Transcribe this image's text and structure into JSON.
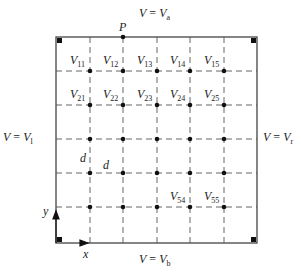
{
  "diagram": {
    "type": "finite-difference grid",
    "boundaries": {
      "top": {
        "var": "V",
        "eq": "=",
        "val": "V",
        "sub": "a"
      },
      "bottom": {
        "var": "V",
        "eq": "=",
        "val": "V",
        "sub": "b"
      },
      "left": {
        "var": "V",
        "eq": "=",
        "val": "V",
        "sub": "l"
      },
      "right": {
        "var": "V",
        "eq": "=",
        "val": "V",
        "sub": "r"
      }
    },
    "point_label": "P",
    "spacing_label_vertical": "d",
    "spacing_label_horizontal": "d",
    "axes": {
      "x": "x",
      "y": "y"
    },
    "nodes": [
      {
        "v": "V",
        "sub": "11"
      },
      {
        "v": "V",
        "sub": "12"
      },
      {
        "v": "V",
        "sub": "13"
      },
      {
        "v": "V",
        "sub": "14"
      },
      {
        "v": "V",
        "sub": "15"
      },
      {
        "v": "V",
        "sub": "21"
      },
      {
        "v": "V",
        "sub": "22"
      },
      {
        "v": "V",
        "sub": "23"
      },
      {
        "v": "V",
        "sub": "24"
      },
      {
        "v": "V",
        "sub": "25"
      },
      {
        "v": "V",
        "sub": "54"
      },
      {
        "v": "V",
        "sub": "55"
      }
    ],
    "grid": {
      "rows": 5,
      "cols": 5
    }
  }
}
